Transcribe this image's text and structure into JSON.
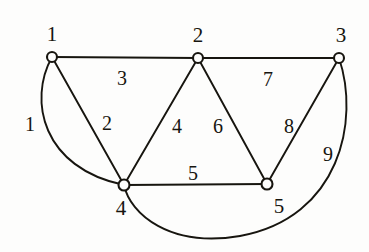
{
  "figure": {
    "type": "undirected-graph-diagram",
    "background_color": "#fdfdfc",
    "ink_color": "#17150f",
    "width": 369,
    "height": 252
  },
  "vertices": [
    {
      "id": "v1",
      "label": "1",
      "cx": 52,
      "cy": 57,
      "r": 5.0,
      "label_x": 52,
      "label_y": 34
    },
    {
      "id": "v2",
      "label": "2",
      "cx": 198,
      "cy": 58,
      "r": 5.0,
      "label_x": 198,
      "label_y": 35
    },
    {
      "id": "v3",
      "label": "3",
      "cx": 339,
      "cy": 58,
      "r": 5.0,
      "label_x": 341,
      "label_y": 35
    },
    {
      "id": "v4",
      "label": "4",
      "cx": 124,
      "cy": 185,
      "r": 5.5,
      "label_x": 121,
      "label_y": 208
    },
    {
      "id": "v5",
      "label": "5",
      "cx": 267,
      "cy": 184,
      "r": 5.5,
      "label_x": 279,
      "label_y": 206
    }
  ],
  "edges": [
    {
      "id": "e1",
      "label": "1",
      "from": "v1",
      "to": "v4",
      "shape": "arc",
      "path": "M 52 57 C 28 100 42 168 124 185",
      "label_x": 30,
      "label_y": 124
    },
    {
      "id": "e2",
      "label": "2",
      "from": "v1",
      "to": "v4",
      "shape": "straight",
      "path": "M 52 57 L 124 185",
      "label_x": 107,
      "label_y": 123
    },
    {
      "id": "e3",
      "label": "3",
      "from": "v1",
      "to": "v2",
      "shape": "straight",
      "path": "M 52 57 L 198 58",
      "label_x": 122,
      "label_y": 78
    },
    {
      "id": "e4",
      "label": "4",
      "from": "v2",
      "to": "v4",
      "shape": "straight",
      "path": "M 198 58 L 124 185",
      "label_x": 177,
      "label_y": 126
    },
    {
      "id": "e5",
      "label": "5",
      "from": "v4",
      "to": "v5",
      "shape": "straight",
      "path": "M 124 185 L 267 184",
      "label_x": 193,
      "label_y": 173
    },
    {
      "id": "e6",
      "label": "6",
      "from": "v2",
      "to": "v5",
      "shape": "straight",
      "path": "M 198 58 L 267 184",
      "label_x": 218,
      "label_y": 126
    },
    {
      "id": "e7",
      "label": "7",
      "from": "v2",
      "to": "v3",
      "shape": "straight",
      "path": "M 198 58 L 339 58",
      "label_x": 268,
      "label_y": 79
    },
    {
      "id": "e8",
      "label": "8",
      "from": "v3",
      "to": "v5",
      "shape": "straight",
      "path": "M 339 58 L 267 184",
      "label_x": 289,
      "label_y": 126
    },
    {
      "id": "e9",
      "label": "9",
      "from": "v3",
      "to": "v4",
      "shape": "arc",
      "path": "M 339 58 C 360 120 340 218 240 236 C 170 248 130 214 124 185",
      "label_x": 328,
      "label_y": 154
    }
  ]
}
